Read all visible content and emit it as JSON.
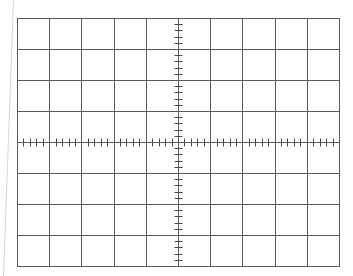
{
  "graticule": {
    "title": "Oscilloscope graticule",
    "left": 17,
    "top": 18,
    "right": 339,
    "bottom": 266,
    "h_divisions": 10,
    "v_divisions": 8,
    "minor_per_division": 5,
    "tick_half_length": 4,
    "grid_color": "#5a5a5a",
    "tick_color": "#4a4a4a",
    "edge_line_color": "#d8d8d8",
    "edge_line": {
      "x1": 13,
      "y1": 0,
      "x2": 3,
      "y2": 276
    }
  }
}
